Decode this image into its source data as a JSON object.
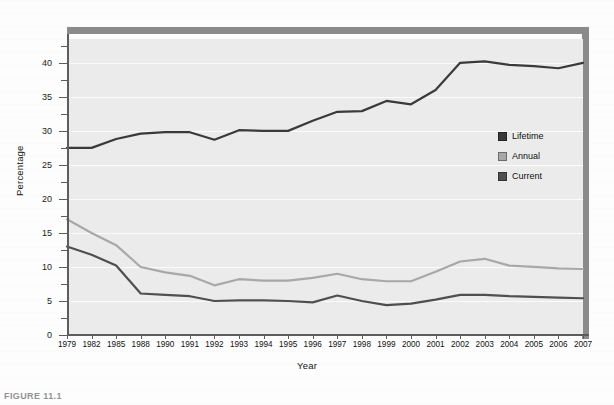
{
  "figure": {
    "caption": "FIGURE 11.1",
    "background_color": "#fdfdfd",
    "plot_background_color": "#ebebeb",
    "frame_bar_color": "#8b8b8b"
  },
  "legend": {
    "position": "inside-right",
    "items": [
      {
        "label": "Lifetime",
        "color": "#3a3a3a"
      },
      {
        "label": "Annual",
        "color": "#a8a8a8"
      },
      {
        "label": "Current",
        "color": "#4f4f4f"
      }
    ]
  },
  "axes": {
    "y_label": "Percentage",
    "x_label": "Year",
    "y_ticks_major": [
      0,
      5,
      10,
      15,
      20,
      25,
      30,
      35,
      40
    ],
    "y_ticks_minor": [
      2.5,
      7.5,
      12.5,
      17.5,
      22.5,
      27.5,
      32.5,
      37.5,
      42.5
    ],
    "y_min": 0,
    "y_max": 43.5
  },
  "chart_data": {
    "type": "line",
    "title": "",
    "subtitle": "",
    "xlabel": "Year",
    "ylabel": "Percentage",
    "ylim": [
      0,
      43.5
    ],
    "grid": true,
    "legend_position": "inside-right",
    "categories": [
      "1979",
      "1982",
      "1985",
      "1988",
      "1990",
      "1991",
      "1992",
      "1993",
      "1994",
      "1995",
      "1996",
      "1997",
      "1998",
      "1999",
      "2000",
      "2001",
      "2002",
      "2003",
      "2004",
      "2005",
      "2006",
      "2007"
    ],
    "series": [
      {
        "name": "Lifetime",
        "color": "#3a3a3a",
        "values": [
          27.5,
          27.5,
          28.8,
          29.6,
          29.8,
          29.8,
          28.7,
          30.1,
          30.0,
          30.0,
          31.5,
          32.8,
          32.9,
          34.4,
          33.9,
          36.0,
          40.0,
          40.2,
          39.7,
          39.5,
          39.2,
          40.0
        ]
      },
      {
        "name": "Annual",
        "color": "#a8a8a8",
        "values": [
          17.0,
          15.0,
          13.2,
          10.0,
          9.2,
          8.7,
          7.3,
          8.2,
          8.0,
          8.0,
          8.4,
          9.0,
          8.2,
          7.9,
          7.9,
          9.3,
          10.8,
          11.2,
          10.2,
          10.0,
          9.8,
          9.7
        ]
      },
      {
        "name": "Current",
        "color": "#4f4f4f",
        "values": [
          13.0,
          11.8,
          10.2,
          6.1,
          5.9,
          5.7,
          5.0,
          5.1,
          5.1,
          5.0,
          4.8,
          5.8,
          5.0,
          4.4,
          4.6,
          5.2,
          5.9,
          5.9,
          5.7,
          5.6,
          5.5,
          5.4
        ]
      }
    ]
  }
}
